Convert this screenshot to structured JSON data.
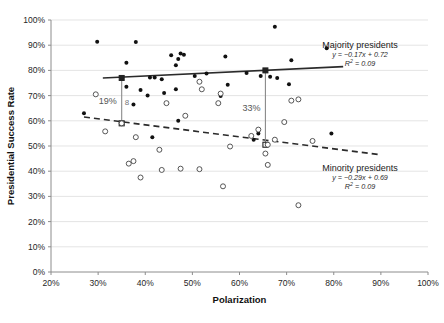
{
  "chart_data": {
    "type": "scatter",
    "title": "",
    "xlabel": "Polarization",
    "ylabel": "Presidential Success Rate",
    "xlim": [
      20,
      100
    ],
    "ylim": [
      0,
      100
    ],
    "xticks": [
      "20%",
      "30%",
      "40%",
      "50%",
      "60%",
      "70%",
      "80%",
      "90%",
      "100%"
    ],
    "yticks": [
      "0%",
      "10%",
      "20%",
      "30%",
      "40%",
      "50%",
      "60%",
      "70%",
      "80%",
      "90%",
      "100%"
    ],
    "grid": true,
    "legend_position": "right",
    "series": [
      {
        "name": "Majority presidents",
        "marker": "filled-circle",
        "equation": "y = −0.17x + 0.72",
        "r_squared": "R² = 0.09",
        "trendline": {
          "style": "solid",
          "x0": 31.0,
          "y0": 77.0,
          "x1": 82.0,
          "y1": 81.5
        },
        "points": [
          [
            29.8,
            91.4
          ],
          [
            38.0,
            91.3
          ],
          [
            78.5,
            88.8
          ],
          [
            67.5,
            97.3
          ],
          [
            36.0,
            83.0
          ],
          [
            57.0,
            85.5
          ],
          [
            45.5,
            86.0
          ],
          [
            47.5,
            86.7
          ],
          [
            48.2,
            86.2
          ],
          [
            47.0,
            84.5
          ],
          [
            46.5,
            82.0
          ],
          [
            71.0,
            84.0
          ],
          [
            53.0,
            78.8
          ],
          [
            61.5,
            79.0
          ],
          [
            50.5,
            77.8
          ],
          [
            36.0,
            73.5
          ],
          [
            43.5,
            76.5
          ],
          [
            42.0,
            77.2
          ],
          [
            41.0,
            77.2
          ],
          [
            64.5,
            77.8
          ],
          [
            66.5,
            77.5
          ],
          [
            68.0,
            77.0
          ],
          [
            39.0,
            72.2
          ],
          [
            44.0,
            71.0
          ],
          [
            57.5,
            74.3
          ],
          [
            70.5,
            74.5
          ],
          [
            40.5,
            70.0
          ],
          [
            56.0,
            69.8
          ],
          [
            37.5,
            66.5
          ],
          [
            46.5,
            72.5
          ],
          [
            27.0,
            63.0
          ],
          [
            47.0,
            60.0
          ],
          [
            64.0,
            55.0
          ],
          [
            41.5,
            53.5
          ],
          [
            79.5,
            55.0
          ],
          [
            63.0,
            52.5
          ]
        ]
      },
      {
        "name": "Minority presidents",
        "marker": "open-circle",
        "equation": "y = −0.29x + 0.69",
        "r_squared": "R² = 0.09",
        "trendline": {
          "style": "dashed",
          "x0": 27.0,
          "y0": 61.5,
          "x1": 90.0,
          "y1": 46.5
        },
        "points": [
          [
            29.5,
            70.5
          ],
          [
            51.5,
            75.5
          ],
          [
            52.0,
            72.5
          ],
          [
            56.0,
            70.8
          ],
          [
            44.5,
            67.0
          ],
          [
            55.5,
            67.0
          ],
          [
            48.5,
            62.0
          ],
          [
            72.5,
            68.5
          ],
          [
            71.0,
            68.0
          ],
          [
            35.0,
            59.0
          ],
          [
            69.5,
            59.5
          ],
          [
            31.5,
            55.8
          ],
          [
            38.0,
            53.5
          ],
          [
            67.5,
            52.5
          ],
          [
            64.0,
            56.5
          ],
          [
            62.5,
            54.0
          ],
          [
            43.0,
            48.5
          ],
          [
            75.5,
            52.0
          ],
          [
            58.0,
            49.8
          ],
          [
            66.0,
            50.5
          ],
          [
            37.5,
            44.0
          ],
          [
            47.5,
            41.0
          ],
          [
            65.5,
            47.0
          ],
          [
            36.5,
            43.0
          ],
          [
            43.5,
            40.5
          ],
          [
            51.5,
            40.8
          ],
          [
            66.0,
            42.5
          ],
          [
            39.0,
            37.5
          ],
          [
            56.5,
            34.0
          ],
          [
            72.5,
            26.5
          ]
        ]
      }
    ],
    "annotations": [
      {
        "label": "19%",
        "x": 35.0,
        "y_top": 77.0,
        "y_bottom": 59.0
      },
      {
        "label": "33%",
        "x": 65.5,
        "y_top": 80.0,
        "y_bottom": 50.5
      }
    ]
  }
}
